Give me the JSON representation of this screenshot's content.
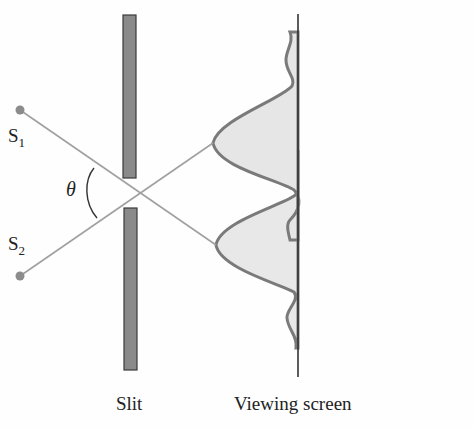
{
  "labels": {
    "source1": "S",
    "source1_sub": "1",
    "source2": "S",
    "source2_sub": "2",
    "angle": "θ",
    "slit": "Slit",
    "screen": "Viewing screen"
  },
  "colors": {
    "slit_fill": "#8a8a8a",
    "slit_stroke": "#3a3a3a",
    "ray": "#9a9a9a",
    "curve": "#7a7a7a",
    "curve_fill": "#e6e6e6",
    "screen_line": "#333333",
    "source_dot": "#8c8c8c"
  }
}
